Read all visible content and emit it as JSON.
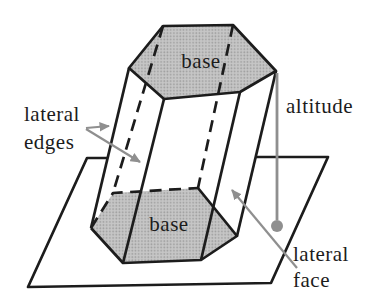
{
  "diagram": {
    "labels": {
      "top_base": "base",
      "bottom_base": "base",
      "lateral_edges": [
        "lateral",
        "edges"
      ],
      "altitude": "altitude",
      "lateral_face": [
        "lateral",
        "face"
      ]
    },
    "colors": {
      "outline": "#1c1c1c",
      "text": "#1c1c1c",
      "background": "#ffffff",
      "plane_fill": "#ffffff",
      "base_fill_average": "#bcbcbc",
      "annotation_gray": "#8f8f8f"
    }
  }
}
